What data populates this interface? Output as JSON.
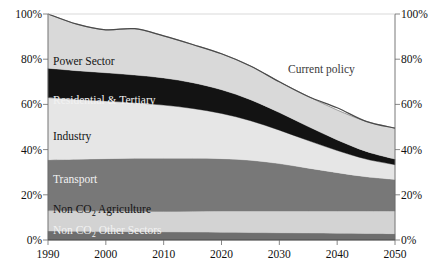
{
  "chart_data": {
    "type": "area",
    "stacked": true,
    "normalized_percent": true,
    "title": "",
    "subtitle": "",
    "xlabel": "",
    "ylabel": "",
    "grid": false,
    "legend_position": "inline-band-labels",
    "x": [
      1990,
      2000,
      2010,
      2020,
      2030,
      2040,
      2050
    ],
    "xlim": [
      1990,
      2050
    ],
    "ylim": [
      0,
      100
    ],
    "x_tick_labels": [
      "1990",
      "2000",
      "2010",
      "2020",
      "2030",
      "2040",
      "2050"
    ],
    "y_tick_labels_left": [
      "100%",
      "80%",
      "60%",
      "40%",
      "20%",
      "0%"
    ],
    "y_tick_labels_right": [
      "100%",
      "80%",
      "60%",
      "40%",
      "20%",
      "0%"
    ],
    "y_ticks": [
      100,
      80,
      60,
      40,
      20,
      0
    ],
    "series": [
      {
        "name": "Non CO2 Other Sectors",
        "label": "Non CO",
        "label_sub": "2",
        "label_tail": " Other Sectors",
        "color": "#6e6e6e",
        "text_color": "#f2f2f2",
        "x": [
          1990,
          1995,
          2000,
          2005,
          2010,
          2015,
          2020,
          2025,
          2030,
          2035,
          2040,
          2045,
          2050
        ],
        "values": [
          4.0,
          3.9,
          3.8,
          3.7,
          3.6,
          3.5,
          3.4,
          3.3,
          3.2,
          3.1,
          3.0,
          2.9,
          2.8
        ]
      },
      {
        "name": "Non CO2 Agriculture",
        "label": "Non CO",
        "label_sub": "2",
        "label_tail": " Agriculture",
        "color": "#d3d3d3",
        "text_color": "#141414",
        "x": [
          1990,
          1995,
          2000,
          2005,
          2010,
          2015,
          2020,
          2025,
          2030,
          2035,
          2040,
          2045,
          2050
        ],
        "values": [
          9.0,
          9.0,
          9.0,
          9.0,
          9.0,
          9.2,
          9.4,
          9.5,
          9.6,
          9.7,
          9.8,
          9.9,
          10.0
        ]
      },
      {
        "name": "Transport",
        "label": "Transport",
        "color": "#787878",
        "text_color": "#efefef",
        "x": [
          1990,
          1995,
          2000,
          2005,
          2010,
          2015,
          2020,
          2025,
          2030,
          2035,
          2040,
          2045,
          2050
        ],
        "values": [
          22.5,
          22.8,
          23.2,
          23.5,
          23.6,
          23.5,
          23.2,
          22.5,
          21.0,
          19.0,
          17.0,
          15.2,
          14.0
        ]
      },
      {
        "name": "Industry",
        "label": "Industry",
        "color": "#e6e6e6",
        "text_color": "#141414",
        "x": [
          1990,
          1995,
          2000,
          2005,
          2010,
          2015,
          2020,
          2025,
          2030,
          2035,
          2040,
          2045,
          2050
        ],
        "values": [
          27.5,
          26.5,
          25.5,
          24.5,
          23.5,
          22.0,
          20.0,
          17.5,
          14.8,
          12.2,
          9.8,
          7.8,
          6.5
        ]
      },
      {
        "name": "Residential & Tertiary",
        "label": "Residential & Tertiary",
        "color": "#131313",
        "text_color": "#f2f2f2",
        "x": [
          1990,
          1995,
          2000,
          2005,
          2010,
          2015,
          2020,
          2025,
          2030,
          2035,
          2040,
          2045,
          2050
        ],
        "values": [
          13.0,
          12.7,
          12.5,
          12.3,
          12.0,
          11.4,
          10.5,
          9.3,
          7.8,
          6.2,
          4.7,
          3.4,
          2.5
        ]
      },
      {
        "name": "Power Sector",
        "label": "Power Sector",
        "color": "#d9d9d9",
        "text_color": "#141414",
        "x": [
          1990,
          1995,
          2000,
          2005,
          2010,
          2015,
          2020,
          2025,
          2030,
          2035,
          2040,
          2045,
          2050
        ],
        "values": [
          24.0,
          20.6,
          19.0,
          20.5,
          18.6,
          16.9,
          15.9,
          14.9,
          13.6,
          13.3,
          13.2,
          13.3,
          13.7
        ]
      }
    ],
    "annotation_line": {
      "name": "Current policy",
      "label": "Current policy",
      "color": "#4a4a4a",
      "x": [
        1990,
        1995,
        2000,
        2005,
        2010,
        2015,
        2020,
        2025,
        2030,
        2035,
        2040,
        2045,
        2050
      ],
      "values": [
        100.0,
        95.5,
        93.0,
        93.5,
        90.3,
        86.5,
        82.4,
        77.0,
        70.0,
        63.5,
        58.5,
        52.5,
        49.5
      ]
    }
  },
  "axes": {
    "left_ticks": [
      {
        "value": 100,
        "label": "100%"
      },
      {
        "value": 80,
        "label": "80%"
      },
      {
        "value": 60,
        "label": "60%"
      },
      {
        "value": 40,
        "label": "40%"
      },
      {
        "value": 20,
        "label": "20%"
      },
      {
        "value": 0,
        "label": "0%"
      }
    ],
    "right_ticks": [
      {
        "value": 100,
        "label": "100%"
      },
      {
        "value": 80,
        "label": "80%"
      },
      {
        "value": 60,
        "label": "60%"
      },
      {
        "value": 40,
        "label": "40%"
      },
      {
        "value": 20,
        "label": "20%"
      },
      {
        "value": 0,
        "label": "0%"
      }
    ],
    "x_ticks": [
      {
        "value": 1990,
        "label": "1990"
      },
      {
        "value": 2000,
        "label": "2000"
      },
      {
        "value": 2010,
        "label": "2010"
      },
      {
        "value": 2020,
        "label": "2020"
      },
      {
        "value": 2030,
        "label": "2030"
      },
      {
        "value": 2040,
        "label": "2040"
      },
      {
        "value": 2050,
        "label": "2050"
      }
    ]
  },
  "band_labels": {
    "power_sector": "Power Sector",
    "residential_tertiary": "Residential & Tertiary",
    "industry": "Industry",
    "transport": "Transport",
    "non_co2_agriculture_head": "Non CO",
    "non_co2_agriculture_sub": "2",
    "non_co2_agriculture_tail": " Agriculture",
    "non_co2_other_head": "Non CO",
    "non_co2_other_sub": "2",
    "non_co2_other_tail": " Other Sectors",
    "current_policy": "Current policy"
  },
  "colors": {
    "power_sector": "#d9d9d9",
    "residential_tertiary": "#131313",
    "industry": "#e6e6e6",
    "transport": "#787878",
    "non_co2_agriculture": "#d3d3d3",
    "non_co2_other_sectors": "#6e6e6e",
    "current_policy_line": "#4a4a4a",
    "axis": "#4a4a4a",
    "background": "#ffffff"
  }
}
